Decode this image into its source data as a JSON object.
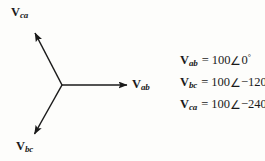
{
  "figure": {
    "type": "phasor-diagram",
    "background_color": "#fdfdfb",
    "line_color": "#1a1a1a"
  },
  "diagram": {
    "origin": {
      "x": 62,
      "y": 85
    },
    "vectors": [
      {
        "name": "V_ab",
        "label_main": "V",
        "label_sub": "ab",
        "angle_deg": 0,
        "magnitude": 100,
        "tip": {
          "x": 130,
          "y": 85
        },
        "label_pos": {
          "x": 132,
          "y": 77
        }
      },
      {
        "name": "V_bc",
        "label_main": "V",
        "label_sub": "bc",
        "angle_deg": -120,
        "magnitude": 100,
        "tip": {
          "x": 31,
          "y": 139
        },
        "label_pos": {
          "x": 16,
          "y": 139
        }
      },
      {
        "name": "V_ca",
        "label_main": "V",
        "label_sub": "ca",
        "angle_deg": -240,
        "magnitude": 100,
        "tip": {
          "x": 32,
          "y": 28
        },
        "label_pos": {
          "x": 11,
          "y": 5
        }
      }
    ]
  },
  "equations": [
    {
      "symbol": "V",
      "subscript": "ab",
      "equals": "=",
      "magnitude": "100",
      "angle_symbol": "∠",
      "angle_value": "0",
      "degree": "°",
      "text": "V_ab = 100∠0°"
    },
    {
      "symbol": "V",
      "subscript": "bc",
      "equals": "=",
      "magnitude": "100",
      "angle_symbol": "∠",
      "angle_value": "−120",
      "degree": "°",
      "text": "V_bc = 100∠−120°"
    },
    {
      "symbol": "V",
      "subscript": "ca",
      "equals": "=",
      "magnitude": "100",
      "angle_symbol": "∠",
      "angle_value": "−240",
      "degree": "°",
      "text": "V_ca = 100∠−240°"
    }
  ]
}
